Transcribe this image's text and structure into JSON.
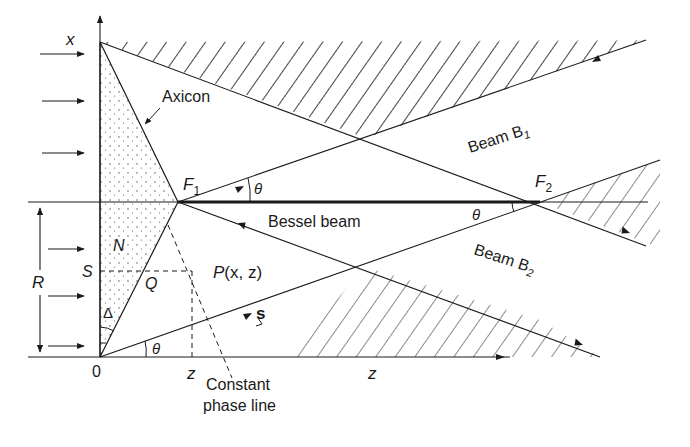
{
  "figure": {
    "colors": {
      "ink": "#1a1a1a",
      "background": "#ffffff"
    }
  },
  "labels": {
    "x_axis": "x",
    "axicon": "Axicon",
    "f1": "F",
    "f1_sub": "1",
    "f2": "F",
    "f2_sub": "2",
    "theta_top": "θ",
    "theta_f2": "θ",
    "theta_bottom": "θ",
    "bessel_beam": "Bessel beam",
    "beam_b1": "Beam B",
    "beam_b1_sub": "1",
    "beam_b2": "Beam B",
    "beam_b2_sub": "2",
    "n": "N",
    "s_point": "S",
    "q_point": "Q",
    "r_radius": "R",
    "delta": "Δ",
    "point_p": "P",
    "point_p_coords": "(x, z)",
    "s_vector": "s",
    "origin": "0",
    "z_tick": "z",
    "z_axis": "z",
    "constant_phase_1": "Constant",
    "constant_phase_2": "phase line"
  }
}
